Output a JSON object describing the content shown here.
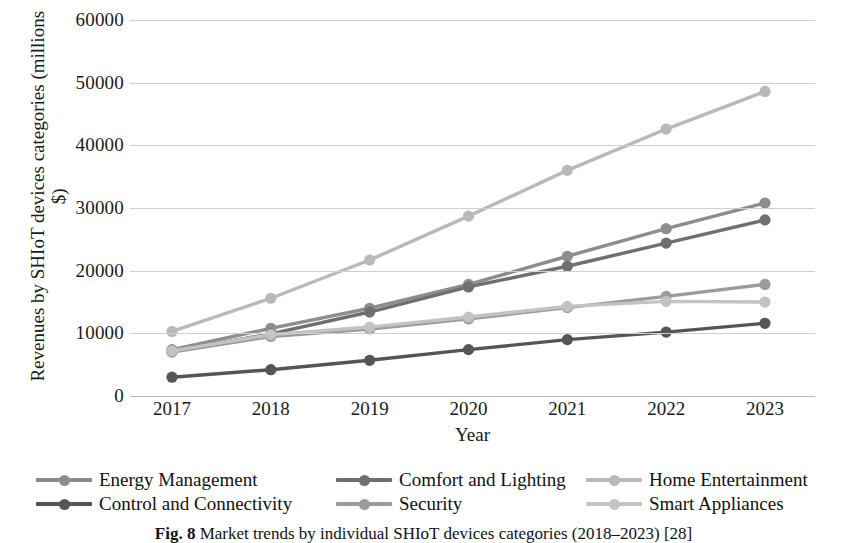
{
  "figure": {
    "caption_bold": "Fig. 8",
    "caption_text": "Market trends by individual SHIoT devices categories (2018–2023) [28]"
  },
  "axes": {
    "x_title": "Year",
    "y_title_line1": "Revenues by SHIoT devices categories (millions",
    "y_title_line2": "$)",
    "y_ticks": [
      "0",
      "10000",
      "20000",
      "30000",
      "40000",
      "50000",
      "60000"
    ],
    "x_ticks": [
      "2017",
      "2018",
      "2019",
      "2020",
      "2021",
      "2022",
      "2023"
    ]
  },
  "legend": {
    "items": [
      {
        "label": "Energy Management",
        "color": "#8d8d8d"
      },
      {
        "label": "Comfort and Lighting",
        "color": "#6f6f6f"
      },
      {
        "label": "Home Entertainment",
        "color": "#b9b9b9"
      },
      {
        "label": "Control and Connectivity",
        "color": "#555555"
      },
      {
        "label": "Security",
        "color": "#9b9b9b"
      },
      {
        "label": "Smart Appliances",
        "color": "#c3c3c3"
      }
    ]
  },
  "chart_data": {
    "type": "line",
    "title": "",
    "xlabel": "Year",
    "ylabel": "Revenues by SHIoT devices categories (millions $)",
    "x": [
      2017,
      2018,
      2019,
      2020,
      2021,
      2022,
      2023
    ],
    "categories": [
      "2017",
      "2018",
      "2019",
      "2020",
      "2021",
      "2022",
      "2023"
    ],
    "ylim": [
      0,
      60000
    ],
    "ytick_values": [
      0,
      10000,
      20000,
      30000,
      40000,
      50000,
      60000
    ],
    "grid": true,
    "legend_position": "bottom",
    "markers": "circle",
    "series": [
      {
        "name": "Energy Management",
        "color": "#8d8d8d",
        "values": [
          7400,
          10800,
          14000,
          17800,
          22300,
          26700,
          30800
        ]
      },
      {
        "name": "Comfort and Lighting",
        "color": "#6f6f6f",
        "values": [
          7100,
          9900,
          13400,
          17400,
          20700,
          24400,
          28100
        ]
      },
      {
        "name": "Home Entertainment",
        "color": "#b9b9b9",
        "values": [
          10300,
          15600,
          21700,
          28700,
          36000,
          42600,
          48600
        ]
      },
      {
        "name": "Control and Connectivity",
        "color": "#555555",
        "values": [
          3000,
          4200,
          5700,
          7400,
          9000,
          10200,
          11600
        ]
      },
      {
        "name": "Security",
        "color": "#9b9b9b",
        "values": [
          7000,
          9500,
          10700,
          12300,
          14100,
          15900,
          17800
        ]
      },
      {
        "name": "Smart Appliances",
        "color": "#c3c3c3",
        "values": [
          7200,
          9800,
          11000,
          12600,
          14300,
          15100,
          15000
        ]
      }
    ]
  }
}
